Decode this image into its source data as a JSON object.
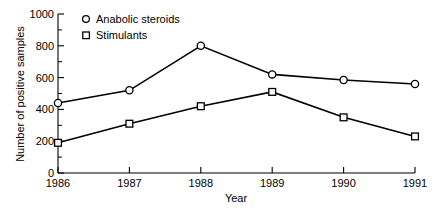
{
  "chart_data": {
    "type": "line",
    "title": "",
    "xlabel": "Year",
    "ylabel": "Number of positive samples",
    "categories": [
      "1986",
      "1987",
      "1988",
      "1989",
      "1990",
      "1991"
    ],
    "x": [
      1986,
      1987,
      1988,
      1989,
      1990,
      1991
    ],
    "xlim": [
      1986,
      1991
    ],
    "ylim": [
      0,
      1000
    ],
    "grid": false,
    "legend_position": "top-left-inside",
    "y_ticks_major": [
      0,
      200,
      400,
      600,
      800,
      1000
    ],
    "y_ticks_minor": [
      100,
      300,
      500,
      700,
      900
    ],
    "y_tick_labels": [
      "0",
      "200",
      "400",
      "600",
      "800",
      "1000"
    ],
    "x_tick_labels": [
      "1986",
      "1987",
      "1988",
      "1989",
      "1990",
      "1991"
    ],
    "series": [
      {
        "name": "Anabolic steroids",
        "marker": "circle-open",
        "values": [
          440,
          520,
          800,
          620,
          585,
          560
        ]
      },
      {
        "name": "Stimulants",
        "marker": "square-open",
        "values": [
          190,
          310,
          420,
          510,
          350,
          230
        ]
      }
    ],
    "colors": {
      "line": "#000000",
      "marker_fill": "#ffffff",
      "background": "#ffffff",
      "text": "#000000"
    }
  },
  "legend": {
    "items": [
      {
        "label": "Anabolic steroids",
        "marker": "circle-open"
      },
      {
        "label": "Stimulants",
        "marker": "square-open"
      }
    ]
  },
  "axes": {
    "x_title": "Year",
    "y_title": "Number of positive samples"
  }
}
